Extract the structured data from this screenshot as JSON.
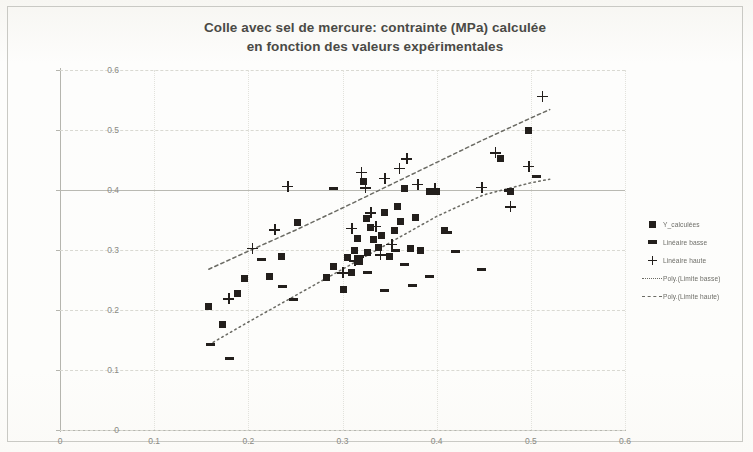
{
  "chart_data": {
    "type": "scatter",
    "title": "Colle avec sel de mercure: contrainte (MPa) calculée en fonction des valeurs expérimentales",
    "title_line1": "Colle avec sel de mercure: contrainte (MPa) calculée",
    "title_line2": "en fonction des valeurs expérimentales",
    "xlabel": "",
    "ylabel": "",
    "xlim": [
      0,
      0.6
    ],
    "ylim": [
      0,
      0.6
    ],
    "xticks": [
      "0",
      "0.1",
      "0.2",
      "0.3",
      "0.4",
      "0.5",
      "0.6"
    ],
    "yticks": [
      "0",
      "0.1",
      "0.2",
      "0.3",
      "0.4",
      "0.5",
      "0.6"
    ],
    "xtick_values": [
      0,
      0.1,
      0.2,
      0.3,
      0.4,
      0.5,
      0.6
    ],
    "ytick_values": [
      0,
      0.1,
      0.2,
      0.3,
      0.4,
      0.5,
      0.6
    ],
    "grid": true,
    "grid_style": "dashed horizontal, dotted vertical",
    "legend_position": "right",
    "marker_color": "#231f1c",
    "trend_color": "#6b6b64",
    "series": [
      {
        "name": "Y_calculées",
        "marker": "square",
        "points": [
          [
            0.158,
            0.206
          ],
          [
            0.173,
            0.176
          ],
          [
            0.188,
            0.228
          ],
          [
            0.196,
            0.253
          ],
          [
            0.222,
            0.256
          ],
          [
            0.235,
            0.289
          ],
          [
            0.252,
            0.346
          ],
          [
            0.283,
            0.254
          ],
          [
            0.29,
            0.272
          ],
          [
            0.301,
            0.234
          ],
          [
            0.305,
            0.288
          ],
          [
            0.31,
            0.262
          ],
          [
            0.313,
            0.3
          ],
          [
            0.316,
            0.32
          ],
          [
            0.318,
            0.281
          ],
          [
            0.322,
            0.414
          ],
          [
            0.325,
            0.352
          ],
          [
            0.327,
            0.296
          ],
          [
            0.33,
            0.338
          ],
          [
            0.333,
            0.318
          ],
          [
            0.338,
            0.305
          ],
          [
            0.341,
            0.324
          ],
          [
            0.345,
            0.362
          ],
          [
            0.35,
            0.29
          ],
          [
            0.355,
            0.333
          ],
          [
            0.358,
            0.373
          ],
          [
            0.362,
            0.348
          ],
          [
            0.366,
            0.402
          ],
          [
            0.372,
            0.302
          ],
          [
            0.378,
            0.354
          ],
          [
            0.383,
            0.3
          ],
          [
            0.392,
            0.398
          ],
          [
            0.4,
            0.398
          ],
          [
            0.408,
            0.333
          ],
          [
            0.468,
            0.452
          ],
          [
            0.478,
            0.398
          ],
          [
            0.498,
            0.5
          ]
        ]
      },
      {
        "name": "Linéaire basse",
        "marker": "dash",
        "points": [
          [
            0.16,
            0.143
          ],
          [
            0.18,
            0.12
          ],
          [
            0.214,
            0.285
          ],
          [
            0.236,
            0.24
          ],
          [
            0.248,
            0.218
          ],
          [
            0.29,
            0.402
          ],
          [
            0.318,
            0.29
          ],
          [
            0.327,
            0.263
          ],
          [
            0.345,
            0.232
          ],
          [
            0.356,
            0.3
          ],
          [
            0.366,
            0.276
          ],
          [
            0.374,
            0.241
          ],
          [
            0.392,
            0.256
          ],
          [
            0.412,
            0.33
          ],
          [
            0.42,
            0.298
          ],
          [
            0.448,
            0.268
          ],
          [
            0.476,
            0.4
          ],
          [
            0.506,
            0.423
          ]
        ]
      },
      {
        "name": "Linéaire haute",
        "marker": "plus",
        "points": [
          [
            0.179,
            0.219
          ],
          [
            0.204,
            0.303
          ],
          [
            0.228,
            0.334
          ],
          [
            0.242,
            0.406
          ],
          [
            0.3,
            0.262
          ],
          [
            0.31,
            0.336
          ],
          [
            0.313,
            0.282
          ],
          [
            0.32,
            0.43
          ],
          [
            0.324,
            0.404
          ],
          [
            0.33,
            0.362
          ],
          [
            0.335,
            0.34
          ],
          [
            0.34,
            0.292
          ],
          [
            0.345,
            0.42
          ],
          [
            0.352,
            0.31
          ],
          [
            0.36,
            0.436
          ],
          [
            0.368,
            0.452
          ],
          [
            0.38,
            0.41
          ],
          [
            0.398,
            0.402
          ],
          [
            0.448,
            0.405
          ],
          [
            0.462,
            0.462
          ],
          [
            0.478,
            0.372
          ],
          [
            0.498,
            0.44
          ],
          [
            0.512,
            0.556
          ]
        ]
      }
    ],
    "trend_curves": [
      {
        "name": "Poly.(Limite basse)",
        "style": "dotted",
        "points": [
          [
            0.158,
            0.142
          ],
          [
            0.2,
            0.18
          ],
          [
            0.25,
            0.224
          ],
          [
            0.3,
            0.268
          ],
          [
            0.35,
            0.312
          ],
          [
            0.4,
            0.356
          ],
          [
            0.45,
            0.392
          ],
          [
            0.5,
            0.412
          ],
          [
            0.52,
            0.418
          ]
        ]
      },
      {
        "name": "Poly.(Limite haute)",
        "style": "dashed-dotted",
        "points": [
          [
            0.158,
            0.268
          ],
          [
            0.2,
            0.298
          ],
          [
            0.25,
            0.333
          ],
          [
            0.3,
            0.37
          ],
          [
            0.35,
            0.408
          ],
          [
            0.4,
            0.446
          ],
          [
            0.45,
            0.484
          ],
          [
            0.5,
            0.52
          ],
          [
            0.52,
            0.534
          ]
        ]
      }
    ],
    "legend": [
      {
        "label": "Y_calculées",
        "key": "square"
      },
      {
        "label": "Linéaire basse",
        "key": "dash"
      },
      {
        "label": "Linéaire haute",
        "key": "plus"
      },
      {
        "label": "Poly.(Limite basse)",
        "key": "dotted-line"
      },
      {
        "label": "Poly.(Limite haute)",
        "key": "dashed-line"
      }
    ]
  }
}
